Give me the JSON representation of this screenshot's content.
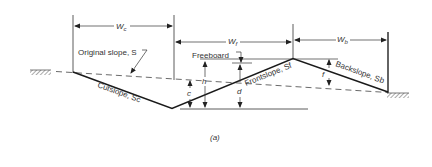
{
  "figure": {
    "caption": "(a)",
    "widths": {
      "cut": {
        "symbol": "W",
        "sub": "c"
      },
      "front": {
        "symbol": "W",
        "sub": "f"
      },
      "back": {
        "symbol": "W",
        "sub": "b"
      }
    },
    "labels": {
      "original_slope": "Original slope, S",
      "freeboard": "Freeboard",
      "cutslope": "Cutslope, Sc",
      "frontslope": "Frontslope, Sf",
      "backslope": "Backslope, Sb"
    },
    "dimensions": {
      "h": "h",
      "c": "c",
      "d": "d",
      "f": "f"
    },
    "colors": {
      "line": "#222222",
      "text": "#333333",
      "background": "#ffffff"
    }
  }
}
